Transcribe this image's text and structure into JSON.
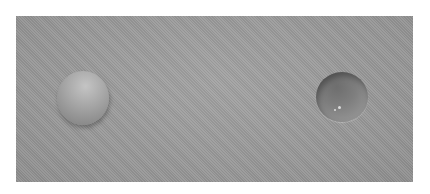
{
  "image": {
    "description": "Photograph of a gray surface showing a convex sphere (left) and a concave dimple (right)",
    "background_color": "#9a9a9a",
    "objects": [
      {
        "name": "convex-sphere",
        "position": "left",
        "color": "#ababab"
      },
      {
        "name": "concave-dish",
        "position": "right",
        "color": "#7e7e7e"
      }
    ]
  }
}
